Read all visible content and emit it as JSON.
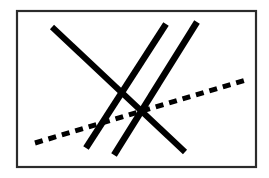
{
  "figure": {
    "canvas": {
      "width": 269,
      "height": 178
    },
    "background_color": "#ffffff",
    "frame": {
      "label": "figure-border",
      "x": 17,
      "y": 11,
      "width": 239,
      "height": 156,
      "stroke_color": "#2b2b2b",
      "stroke_width": 2.2,
      "fill_color": "#ffffff"
    },
    "line_color": "#000000",
    "lines": [
      {
        "id": "line-1",
        "label": "descending-diagonal-long",
        "style": "solid",
        "stroke_width": 6,
        "x1": 52,
        "y1": 27,
        "x2": 185,
        "y2": 152
      },
      {
        "id": "line-2",
        "label": "steep-line-left",
        "style": "solid",
        "stroke_width": 6.5,
        "x1": 166,
        "y1": 24,
        "x2": 86,
        "y2": 148
      },
      {
        "id": "line-3",
        "label": "steep-line-right",
        "style": "solid",
        "stroke_width": 6.5,
        "x1": 197,
        "y1": 22,
        "x2": 114,
        "y2": 155
      },
      {
        "id": "line-4",
        "label": "dashed-ascending-line",
        "style": "dashed",
        "stroke_width": 5,
        "dash_pattern": "8 6",
        "x1": 35,
        "y1": 143,
        "x2": 249,
        "y2": 79
      }
    ],
    "artifact": {
      "label": "scan-speck",
      "x": 1,
      "y": 27
    }
  }
}
